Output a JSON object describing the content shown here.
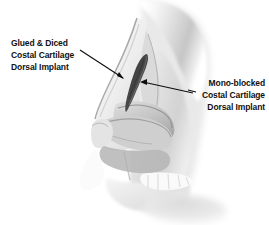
{
  "figure": {
    "kind": "medical-illustration",
    "background_color": "#ffffff",
    "ink_color": "#111111",
    "graft_color": "#3d3d3d",
    "tissue_light": "#f2f2f2",
    "tissue_mid": "#c9c9c9",
    "tissue_dark": "#8e8e8e"
  },
  "annotations": {
    "left": {
      "name": "glued-and-diced-graft-label",
      "align": "left",
      "lines": [
        "Glued & Diced",
        "Costal Cartilage",
        "Dorsal Implant"
      ],
      "leader": {
        "start_x": 80,
        "start_y": 50,
        "end_x": 124,
        "end_y": 79,
        "arrow_at": "end"
      }
    },
    "right": {
      "name": "mono-blocked-graft-label",
      "align": "right",
      "lines": [
        "Mono-blocked",
        "Costal Cartilage",
        "Dorsal Implant"
      ],
      "leader": {
        "start_x": 193,
        "start_y": 93,
        "end_x": 140,
        "end_y": 82,
        "arrow_at": "end"
      }
    }
  },
  "anatomy": {
    "regions": [
      "forehead-glabella",
      "nasal-dorsum",
      "nasal-bone",
      "septum",
      "upper-lateral-cartilage",
      "lower-lateral-cartilage",
      "nasal-tip",
      "columella",
      "nostril",
      "upper-lip",
      "maxilla",
      "upper-teeth"
    ],
    "graft": {
      "name": "dorsal-cartilage-implant",
      "shape": "elongated-tapered-spindle",
      "orientation": "superior-right-to-inferior-left"
    }
  }
}
